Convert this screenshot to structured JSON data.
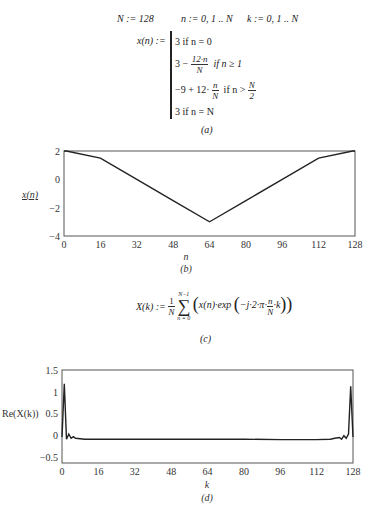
{
  "section_a": {
    "defs": {
      "N_def": "N := 128",
      "n_def": "n := 0, 1 .. N",
      "k_def": "k := 0, 1 .. N"
    },
    "x_lhs": "x(n) :=",
    "branches": [
      {
        "text": "3 if n = 0"
      },
      {
        "pre": "3 −",
        "num": "12·n",
        "den": "N",
        "cond": "if n ≥ 1"
      },
      {
        "pre": "−9 + 12·",
        "num": "n",
        "den": "N",
        "cond": "if n >",
        "cond_num": "N",
        "cond_den": "2"
      },
      {
        "text": "3 if n = N"
      }
    ],
    "caption": "(a)"
  },
  "section_c": {
    "lhs": "X(k) :=",
    "frac_num": "1",
    "frac_den": "N",
    "sum_upper": "N−1",
    "sum_lower": "n = 0",
    "body_pre": "x(n)·exp",
    "body_inner_pre": "−j·2·π·",
    "body_inner_num": "n",
    "body_inner_den": "N",
    "body_inner_post": "·k",
    "caption": "(c)"
  },
  "chart_data": [
    {
      "type": "line",
      "panel": "(b)",
      "title": "",
      "xlabel": "n",
      "ylabel": "x(n)",
      "xlim": [
        0,
        128
      ],
      "ylim": [
        -4,
        2
      ],
      "xticks": [
        0,
        16,
        32,
        48,
        64,
        80,
        96,
        112,
        128
      ],
      "yticks": [
        2,
        0,
        -2,
        -4
      ],
      "grid": false,
      "series": [
        {
          "name": "x(n)",
          "x": [
            0,
            1,
            16,
            32,
            48,
            64,
            65,
            80,
            96,
            112,
            127,
            128
          ],
          "values": [
            2,
            2.906,
            1.5,
            0,
            -1.5,
            -3,
            -2.906,
            -1.5,
            0,
            1.5,
            2.906,
            2
          ]
        }
      ],
      "caption": "(b)"
    },
    {
      "type": "line",
      "panel": "(d)",
      "title": "",
      "xlabel": "k",
      "ylabel": "Re(X(k))",
      "xlim": [
        0,
        128
      ],
      "ylim": [
        -0.65,
        1.5
      ],
      "xticks": [
        0,
        16,
        32,
        48,
        64,
        80,
        96,
        112,
        128
      ],
      "yticks": [
        1.5,
        1,
        0.5,
        0,
        -0.5
      ],
      "grid": false,
      "series": [
        {
          "name": "Re(X(k))",
          "x": [
            0,
            1,
            2,
            3,
            4,
            5,
            6,
            8,
            10,
            16,
            32,
            48,
            64,
            80,
            96,
            112,
            118,
            120,
            122,
            123,
            124,
            125,
            126,
            127,
            128
          ],
          "values": [
            -0.05,
            1.18,
            -0.1,
            0.02,
            -0.08,
            -0.04,
            -0.08,
            -0.09,
            -0.1,
            -0.1,
            -0.1,
            -0.1,
            -0.1,
            -0.1,
            -0.11,
            -0.11,
            -0.1,
            -0.08,
            -0.06,
            -0.1,
            -0.02,
            -0.08,
            0.02,
            1.12,
            -0.05
          ]
        }
      ],
      "caption": "(d)"
    }
  ]
}
